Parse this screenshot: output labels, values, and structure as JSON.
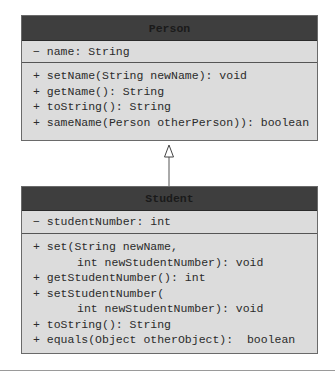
{
  "diagram": {
    "type": "uml-class-diagram",
    "relationship": "inheritance",
    "colors": {
      "header": "#3e3e3e",
      "body": "#dcdcdc",
      "border": "#6a6a6a",
      "text": "#2b2b2b"
    },
    "classes": [
      {
        "name": "Person",
        "attributes": [
          "− name: String"
        ],
        "operations": [
          "+ setName(String newName): void",
          "+ getName(): String",
          "+ toString(): String",
          "+ sameName(Person otherPerson)): boolean"
        ]
      },
      {
        "name": "Student",
        "attributes": [
          "− studentNumber: int"
        ],
        "operations": [
          "+ set(String newName,",
          "int newStudentNumber): void",
          "+ getStudentNumber(): int",
          "+ setStudentNumber(",
          "int newStudentNumber): void",
          "+ toString(): String",
          "+ equals(Object otherObject):  boolean"
        ]
      }
    ],
    "edges": [
      {
        "from": "Student",
        "to": "Person",
        "kind": "generalization"
      }
    ]
  }
}
